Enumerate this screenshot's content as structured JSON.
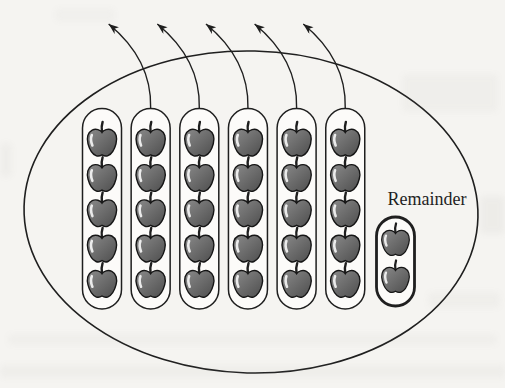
{
  "figure": {
    "remainder_label": "Remainder",
    "group_count": 6,
    "apples_per_group": 5,
    "remainder_apple_count": 2,
    "arrow_count": 5,
    "total_apples": 32,
    "colors": {
      "ink": "#1f1f1f",
      "paper": "#f5f4f1",
      "pill_fill": "#fcfbf9",
      "apple_light": "#8a8a8a",
      "apple_dark": "#4e4e4e"
    }
  }
}
